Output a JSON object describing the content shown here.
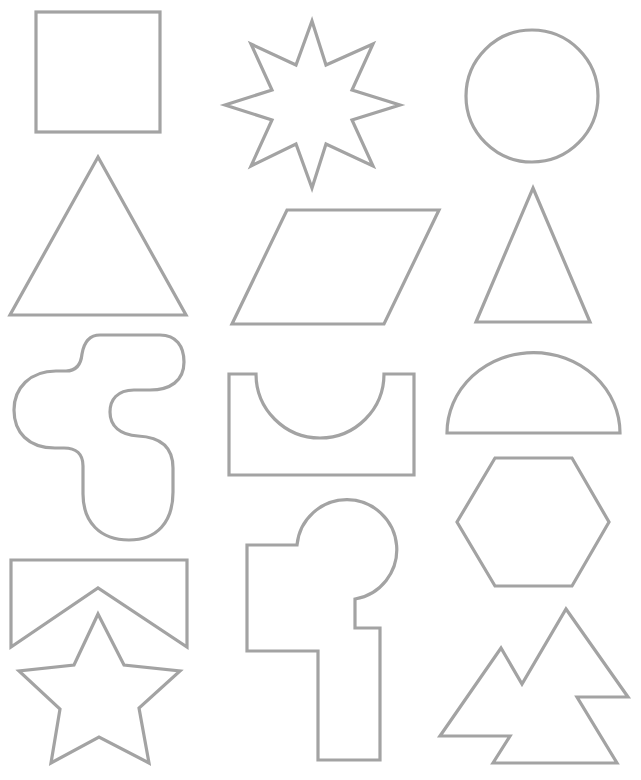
{
  "page": {
    "background": "#ffffff",
    "stroke_color": "#a3a3a3"
  },
  "shapes": [
    {
      "id": "square",
      "label": "Square",
      "row": 1,
      "col": 1
    },
    {
      "id": "eight-point-star",
      "label": "Eight-pointed star",
      "row": 1,
      "col": 2
    },
    {
      "id": "circle",
      "label": "Circle",
      "row": 1,
      "col": 3
    },
    {
      "id": "equilateral-triangle",
      "label": "Triangle",
      "row": 2,
      "col": 1
    },
    {
      "id": "parallelogram",
      "label": "Parallelogram",
      "row": 2,
      "col": 2
    },
    {
      "id": "isosceles-triangle",
      "label": "Narrow triangle",
      "row": 2,
      "col": 3
    },
    {
      "id": "blob",
      "label": "Rounded blob puzzle piece",
      "row": 3,
      "col": 1
    },
    {
      "id": "notched-rectangle",
      "label": "Rectangle with semicircle cutout",
      "row": 3,
      "col": 2
    },
    {
      "id": "semicircle",
      "label": "Semicircle",
      "row": 3,
      "col": 3
    },
    {
      "id": "hexagon",
      "label": "Hexagon",
      "row": 4,
      "col": 3
    },
    {
      "id": "chevron-banner",
      "label": "Rectangle with V notch",
      "row": 4,
      "col": 1
    },
    {
      "id": "keyhole-l-shape",
      "label": "Stepped shape with circle cap",
      "row": 4,
      "col": 2
    },
    {
      "id": "five-point-star",
      "label": "Five-pointed star",
      "row": 5,
      "col": 1
    },
    {
      "id": "mountains",
      "label": "Twin peaks shape",
      "row": 5,
      "col": 3
    }
  ]
}
